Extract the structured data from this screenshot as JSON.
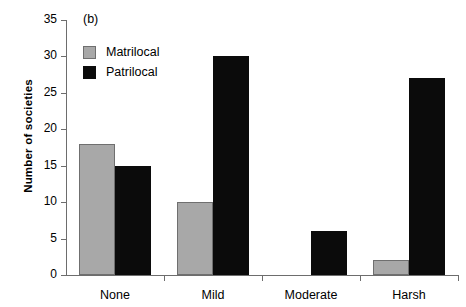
{
  "panel": {
    "label": "(b)"
  },
  "legend": {
    "entries": [
      {
        "name": "Matrilocal",
        "color": "#a8a8a8"
      },
      {
        "name": "Patrilocal",
        "color": "#0b0b0b"
      }
    ]
  },
  "axes": {
    "ylabel": "Number of societies",
    "yticks": [
      "0",
      "5",
      "10",
      "15",
      "20",
      "25",
      "30",
      "35"
    ]
  },
  "chart_data": {
    "type": "bar",
    "title": "(b)",
    "xlabel": "",
    "ylabel": "Number of societies",
    "categories": [
      "None",
      "Mild",
      "Moderate",
      "Harsh"
    ],
    "series": [
      {
        "name": "Matrilocal",
        "color": "#a8a8a8",
        "values": [
          18,
          10,
          0,
          2
        ]
      },
      {
        "name": "Patrilocal",
        "color": "#0b0b0b",
        "values": [
          15,
          30,
          6,
          27
        ]
      }
    ],
    "ylim": [
      0,
      35
    ],
    "ytick_step": 5,
    "grid": false,
    "legend_position": "upper-left-inside"
  }
}
